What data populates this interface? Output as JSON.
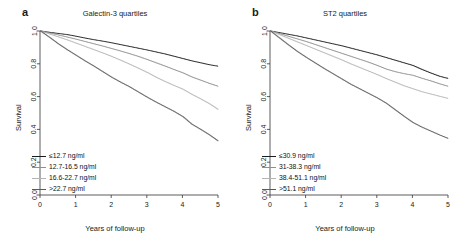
{
  "figure": {
    "panels": [
      {
        "letter": "a",
        "title": "Galectin-3 quartiles",
        "xlabel": "Years of follow-up",
        "ylabel": "Survival",
        "legend": [
          {
            "label": "≤12.7 ng/ml",
            "color": "#1a1a1a"
          },
          {
            "label": "12.7-16.5 ng/ml",
            "color": "#8f8f8f"
          },
          {
            "label": "16.6-22.7 ng/ml",
            "color": "#b5b5b5"
          },
          {
            "label": ">22.7 ng/ml",
            "color": "#5a5a5a"
          }
        ]
      },
      {
        "letter": "b",
        "title": "ST2 quartiles",
        "xlabel": "Years of follow-up",
        "ylabel": "Survival",
        "legend": [
          {
            "label": "≤30.9 ng/ml",
            "color": "#1a1a1a"
          },
          {
            "label": "31-38.3 ng/ml",
            "color": "#8f8f8f"
          },
          {
            "label": "38.4-51.1 ng/ml",
            "color": "#b5b5b5"
          },
          {
            "label": ">51.1 ng/ml",
            "color": "#5a5a5a"
          }
        ]
      }
    ]
  },
  "chart_data": [
    {
      "type": "line",
      "title": "Galectin-3 quartiles",
      "panel": "a",
      "xlabel": "Years of follow-up",
      "ylabel": "Survival",
      "xlim": [
        0,
        5
      ],
      "ylim": [
        0,
        1
      ],
      "xticks": [
        0,
        1,
        2,
        3,
        4,
        5
      ],
      "yticks": [
        0.0,
        0.2,
        0.4,
        0.6,
        0.8,
        1.0
      ],
      "xtick_labels": [
        "0",
        "1",
        "2",
        "3",
        "4",
        "5"
      ],
      "ytick_labels": [
        "0.0",
        "0.2",
        "0.4",
        "0.6",
        "0.8",
        "1.0"
      ],
      "grid": false,
      "legend_position": "lower-left",
      "x": [
        0,
        0.25,
        0.5,
        0.75,
        1,
        1.25,
        1.5,
        1.75,
        2,
        2.25,
        2.5,
        2.75,
        3,
        3.25,
        3.5,
        3.75,
        4,
        4.25,
        4.5,
        4.75,
        5
      ],
      "series": [
        {
          "name": "≤12.7 ng/ml",
          "color": "#1a1a1a",
          "values": [
            1.0,
            0.992,
            0.985,
            0.978,
            0.968,
            0.957,
            0.947,
            0.938,
            0.928,
            0.917,
            0.906,
            0.895,
            0.884,
            0.872,
            0.86,
            0.846,
            0.832,
            0.818,
            0.806,
            0.794,
            0.785
          ]
        },
        {
          "name": "12.7-16.5 ng/ml",
          "color": "#8f8f8f",
          "values": [
            1.0,
            0.988,
            0.976,
            0.963,
            0.95,
            0.936,
            0.922,
            0.908,
            0.893,
            0.878,
            0.862,
            0.845,
            0.826,
            0.806,
            0.786,
            0.765,
            0.745,
            0.72,
            0.7,
            0.68,
            0.662
          ]
        },
        {
          "name": "16.6-22.7 ng/ml",
          "color": "#b5b5b5",
          "values": [
            1.0,
            0.982,
            0.964,
            0.946,
            0.926,
            0.906,
            0.886,
            0.866,
            0.845,
            0.822,
            0.798,
            0.773,
            0.747,
            0.718,
            0.692,
            0.668,
            0.645,
            0.614,
            0.586,
            0.556,
            0.52
          ]
        },
        {
          "name": ">22.7 ng/ml",
          "color": "#5a5a5a",
          "values": [
            1.0,
            0.962,
            0.922,
            0.886,
            0.852,
            0.818,
            0.786,
            0.752,
            0.718,
            0.688,
            0.66,
            0.628,
            0.596,
            0.566,
            0.538,
            0.51,
            0.478,
            0.432,
            0.4,
            0.366,
            0.328
          ]
        }
      ]
    },
    {
      "type": "line",
      "title": "ST2 quartiles",
      "panel": "b",
      "xlabel": "Years of follow-up",
      "ylabel": "Survival",
      "xlim": [
        0,
        5
      ],
      "ylim": [
        0,
        1
      ],
      "xticks": [
        0,
        1,
        2,
        3,
        4,
        5
      ],
      "yticks": [
        0.0,
        0.2,
        0.4,
        0.6,
        0.8,
        1.0
      ],
      "xtick_labels": [
        "0",
        "1",
        "2",
        "3",
        "4",
        "5"
      ],
      "ytick_labels": [
        "0.0",
        "0.2",
        "0.4",
        "0.6",
        "0.8",
        "1.0"
      ],
      "grid": false,
      "legend_position": "lower-left",
      "x": [
        0,
        0.25,
        0.5,
        0.75,
        1,
        1.25,
        1.5,
        1.75,
        2,
        2.25,
        2.5,
        2.75,
        3,
        3.25,
        3.5,
        3.75,
        4,
        4.25,
        4.5,
        4.75,
        5
      ],
      "series": [
        {
          "name": "≤30.9 ng/ml",
          "color": "#1a1a1a",
          "values": [
            1.0,
            0.99,
            0.98,
            0.97,
            0.958,
            0.946,
            0.934,
            0.922,
            0.91,
            0.896,
            0.882,
            0.868,
            0.854,
            0.838,
            0.822,
            0.806,
            0.79,
            0.766,
            0.744,
            0.724,
            0.71
          ]
        },
        {
          "name": "31-38.3 ng/ml",
          "color": "#8f8f8f",
          "values": [
            1.0,
            0.984,
            0.968,
            0.952,
            0.936,
            0.918,
            0.9,
            0.882,
            0.864,
            0.846,
            0.828,
            0.81,
            0.79,
            0.768,
            0.752,
            0.74,
            0.73,
            0.712,
            0.696,
            0.678,
            0.662
          ]
        },
        {
          "name": "38.4-51.1 ng/ml",
          "color": "#b5b5b5",
          "values": [
            1.0,
            0.978,
            0.956,
            0.934,
            0.912,
            0.89,
            0.868,
            0.846,
            0.824,
            0.8,
            0.778,
            0.756,
            0.734,
            0.71,
            0.688,
            0.666,
            0.648,
            0.63,
            0.616,
            0.602,
            0.588
          ]
        },
        {
          "name": ">51.1 ng/ml",
          "color": "#5a5a5a",
          "values": [
            1.0,
            0.958,
            0.916,
            0.876,
            0.84,
            0.806,
            0.772,
            0.74,
            0.708,
            0.676,
            0.648,
            0.62,
            0.592,
            0.56,
            0.52,
            0.48,
            0.442,
            0.414,
            0.39,
            0.366,
            0.344
          ]
        }
      ]
    }
  ]
}
